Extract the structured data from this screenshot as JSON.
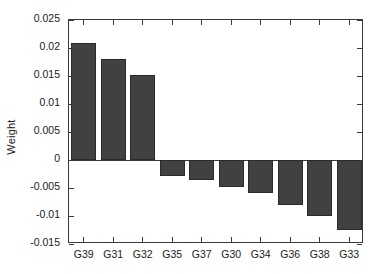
{
  "chart_data": {
    "type": "bar",
    "title": "",
    "xlabel": "",
    "ylabel": "Weight",
    "categories": [
      "G39",
      "G31",
      "G32",
      "G35",
      "G37",
      "G30",
      "G34",
      "G36",
      "G38",
      "G33"
    ],
    "values": [
      0.0209,
      0.018,
      0.0151,
      -0.0028,
      -0.0035,
      -0.0048,
      -0.0059,
      -0.0081,
      -0.01,
      -0.0125
    ],
    "series": [
      {
        "name": "Weight",
        "values": [
          0.0209,
          0.018,
          0.0151,
          -0.0028,
          -0.0035,
          -0.0048,
          -0.0059,
          -0.0081,
          -0.01,
          -0.0125
        ]
      }
    ],
    "ylim": [
      -0.015,
      0.025
    ],
    "yticks": [
      0.025,
      0.02,
      0.015,
      0.01,
      0.005,
      0,
      -0.005,
      -0.01,
      -0.015
    ],
    "ytick_labels": [
      "0.025",
      "0.02",
      "0.015",
      "0.01",
      "0.005",
      "0",
      "-0.005",
      "-0.01",
      "-0.015"
    ],
    "grid": false,
    "legend": null,
    "bar_color": "#414141",
    "axis_color": "#3a3a3a",
    "background": "#ffffff"
  }
}
